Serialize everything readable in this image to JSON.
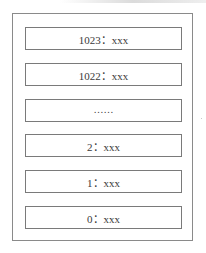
{
  "diagram": {
    "type": "stack",
    "slots": [
      {
        "label": "1023：xxx"
      },
      {
        "label": "1022：xxx"
      },
      {
        "label": "……"
      },
      {
        "label": "2：xxx"
      },
      {
        "label": "1：xxx"
      },
      {
        "label": "0：xxx"
      }
    ]
  },
  "colors": {
    "border": "#7a7a7a",
    "text": "#3a3a3a",
    "background": "#ffffff"
  }
}
